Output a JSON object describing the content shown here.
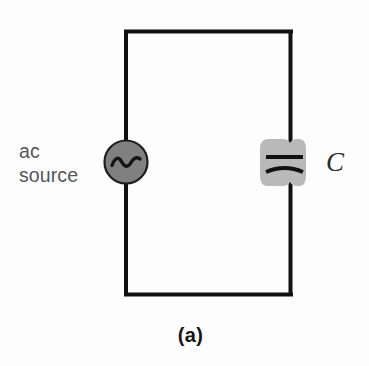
{
  "figure": {
    "type": "circuit-diagram",
    "caption": "(a)",
    "background_color": "#fdfdfd"
  },
  "labels": {
    "ac_source": "ac\nsource",
    "ac_source_line1": "ac",
    "ac_source_line2": "source",
    "capacitor": "C",
    "caption": "(a)"
  },
  "components": {
    "ac_source": {
      "name": "ac source",
      "symbol": "sine-wave-in-circle",
      "fill_color": "#808080",
      "stroke_color": "#1a1a1a",
      "center_x": 126,
      "center_y": 162,
      "radius": 22
    },
    "capacitor": {
      "name": "capacitor",
      "symbol": "polarized-capacitor",
      "label": "C",
      "highlight_color": "#b9b9b9",
      "plate_color": "#111111",
      "top_plate_y": 157,
      "bottom_plate_y": 169,
      "plate_x_start": 266,
      "plate_x_end": 303
    },
    "wire_loop": {
      "name": "circuit loop",
      "color": "#111111",
      "stroke_width": 4,
      "left": 126,
      "top": 30,
      "right": 291,
      "bottom": 296
    }
  }
}
